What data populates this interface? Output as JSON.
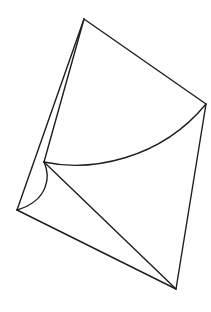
{
  "diagram": {
    "type": "folded-paper-geometry",
    "background": "#ffffff",
    "stroke_color": "#1e1e1e",
    "stroke_width": 1.4,
    "vertices": {
      "top": [
        84,
        19
      ],
      "right": [
        206,
        104
      ],
      "bottom": [
        176,
        289
      ],
      "left": [
        17,
        210
      ],
      "inner": [
        44,
        162
      ]
    },
    "edges": [
      {
        "name": "top-right-edge",
        "d": "M84 19 L206 104"
      },
      {
        "name": "right-bottom-edge",
        "d": "M206 104 L176 289"
      },
      {
        "name": "bottom-left-edge",
        "d": "M176 289 L17 210"
      },
      {
        "name": "left-top-edge",
        "d": "M17 210 L84 19"
      },
      {
        "name": "top-inner-edge",
        "d": "M84 19 L44 162"
      },
      {
        "name": "inner-bottom-diagonal",
        "d": "M44 162 L176 289"
      },
      {
        "name": "inner-right-arc",
        "d": "M44 162 C90 172 160 160 206 104"
      },
      {
        "name": "inner-left-arc",
        "d": "M44 162 C50 175 50 200 17 210"
      }
    ]
  }
}
